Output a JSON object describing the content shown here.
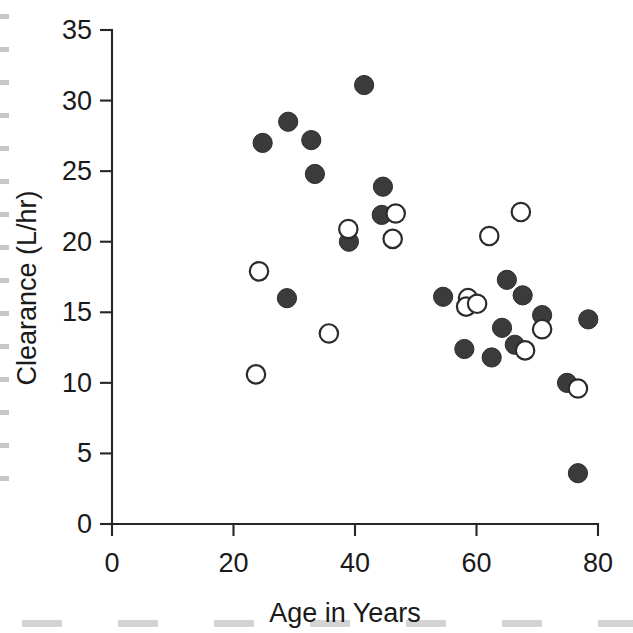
{
  "figure": {
    "background_color": "#ffffff",
    "ink_color": "#2b2b2b",
    "marker_fill_color": "#3b3b3b"
  },
  "chart_data": {
    "type": "scatter",
    "title": "",
    "xlabel": "Age in Years",
    "ylabel": "Clearance (L/hr)",
    "xlim": [
      0,
      80
    ],
    "ylim": [
      0,
      35
    ],
    "xticks": [
      0,
      20,
      40,
      60,
      80
    ],
    "yticks": [
      0,
      5,
      10,
      15,
      20,
      25,
      30,
      35
    ],
    "xtick_labels": [
      "0",
      "20",
      "40",
      "60",
      "80"
    ],
    "ytick_labels": [
      "0",
      "5",
      "10",
      "15",
      "20",
      "25",
      "30",
      "35"
    ],
    "grid": false,
    "legend": false,
    "legend_position": "none",
    "series": [
      {
        "name": "filled",
        "marker": "filled-circle",
        "marker_color": "#3b3b3b",
        "points": [
          {
            "x": 24.8,
            "y": 27.0
          },
          {
            "x": 29.0,
            "y": 28.5
          },
          {
            "x": 32.8,
            "y": 27.2
          },
          {
            "x": 33.4,
            "y": 24.8
          },
          {
            "x": 41.5,
            "y": 31.1
          },
          {
            "x": 44.6,
            "y": 23.9
          },
          {
            "x": 44.4,
            "y": 21.9
          },
          {
            "x": 39.0,
            "y": 20.0
          },
          {
            "x": 28.8,
            "y": 16.0
          },
          {
            "x": 54.5,
            "y": 16.1
          },
          {
            "x": 65.0,
            "y": 17.3
          },
          {
            "x": 67.6,
            "y": 16.2
          },
          {
            "x": 70.8,
            "y": 14.8
          },
          {
            "x": 78.4,
            "y": 14.5
          },
          {
            "x": 64.2,
            "y": 13.9
          },
          {
            "x": 66.3,
            "y": 12.7
          },
          {
            "x": 58.0,
            "y": 12.4
          },
          {
            "x": 62.5,
            "y": 11.8
          },
          {
            "x": 74.9,
            "y": 10.0
          },
          {
            "x": 76.7,
            "y": 3.6
          }
        ]
      },
      {
        "name": "open",
        "marker": "open-circle",
        "marker_color": "#ffffff",
        "points": [
          {
            "x": 24.2,
            "y": 17.9
          },
          {
            "x": 23.7,
            "y": 10.6
          },
          {
            "x": 35.7,
            "y": 13.5
          },
          {
            "x": 38.9,
            "y": 20.9
          },
          {
            "x": 46.2,
            "y": 20.2
          },
          {
            "x": 46.7,
            "y": 22.0
          },
          {
            "x": 62.1,
            "y": 20.4
          },
          {
            "x": 67.3,
            "y": 22.1
          },
          {
            "x": 58.6,
            "y": 16.0
          },
          {
            "x": 58.3,
            "y": 15.4
          },
          {
            "x": 60.1,
            "y": 15.6
          },
          {
            "x": 70.8,
            "y": 13.8
          },
          {
            "x": 68.0,
            "y": 12.3
          },
          {
            "x": 76.7,
            "y": 9.6
          }
        ]
      }
    ]
  }
}
